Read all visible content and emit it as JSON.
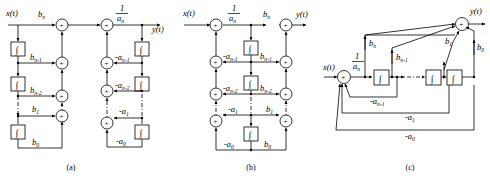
{
  "figure": {
    "type": "block-diagram",
    "panels": [
      {
        "id": "a",
        "caption": "(a)",
        "form": "direct-form-I (cascade of numerator then denominator sections)",
        "input_label": "x(t)",
        "output_label": "y(t)",
        "gain_label_num": "1",
        "gain_label_den": "a",
        "gain_label_den_sub": "n",
        "feedforward_labels": [
          {
            "main": "b",
            "sub": "n"
          },
          {
            "main": "b",
            "sub": "n-1"
          },
          {
            "main": "b",
            "sub": "n-2"
          },
          {
            "main": "b",
            "sub": "1"
          },
          {
            "main": "b",
            "sub": "0"
          }
        ],
        "feedback_labels": [
          {
            "main": "-a",
            "sub": "n-1"
          },
          {
            "main": "-a",
            "sub": "n-2"
          },
          {
            "main": "-a",
            "sub": "1"
          },
          {
            "main": "-a",
            "sub": "0"
          }
        ],
        "integrator_glyph": "∫",
        "adder_glyph": "+",
        "integrator_count_left": 3,
        "integrator_count_right": 3,
        "adder_count": 7
      },
      {
        "id": "b",
        "caption": "(b)",
        "form": "direct-form-II (canonical, shared integrators)",
        "input_label": "x(t)",
        "output_label": "y(t)",
        "gain_label_num": "1",
        "gain_label_den": "a",
        "gain_label_den_sub": "n",
        "feedforward_labels": [
          {
            "main": "b",
            "sub": "n"
          },
          {
            "main": "b",
            "sub": "n-1"
          },
          {
            "main": "b",
            "sub": "n-2"
          },
          {
            "main": "b",
            "sub": "1"
          },
          {
            "main": "b",
            "sub": "0"
          }
        ],
        "feedback_labels": [
          {
            "main": "-a",
            "sub": "n-1"
          },
          {
            "main": "-a",
            "sub": "n-2"
          },
          {
            "main": "-a",
            "sub": "1"
          },
          {
            "main": "-a",
            "sub": "0"
          }
        ],
        "integrator_glyph": "∫",
        "adder_glyph": "+",
        "integrator_count": 3,
        "adder_count": 8
      },
      {
        "id": "c",
        "caption": "(c)",
        "form": "direct-form-II redrawn horizontally (single summing node)",
        "input_label": "x(t)",
        "output_label": "y(t)",
        "gain_label_num": "1",
        "gain_label_den": "a",
        "gain_label_den_sub": "n",
        "feedforward_labels": [
          {
            "main": "b",
            "sub": "n"
          },
          {
            "main": "b",
            "sub": "n-1"
          },
          {
            "main": "b",
            "sub": "1"
          },
          {
            "main": "b",
            "sub": "0"
          }
        ],
        "feedback_labels": [
          {
            "main": "-a",
            "sub": "n-1"
          },
          {
            "main": "-a",
            "sub": "1"
          },
          {
            "main": "-a",
            "sub": "0"
          }
        ],
        "integrator_glyph": "∫",
        "adder_glyph": "+",
        "integrator_count": 3,
        "adder_count": 2
      }
    ],
    "colors": {
      "line": "#000000",
      "background": "#ffffff",
      "text": "#000000"
    }
  }
}
